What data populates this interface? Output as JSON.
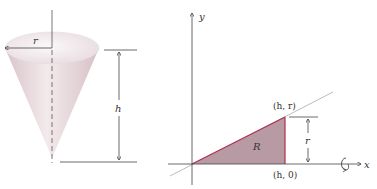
{
  "figure": {
    "left": {
      "title": "cone",
      "labels": {
        "radius": "r",
        "height": "h"
      }
    },
    "right": {
      "title": "region-diagram",
      "labels": {
        "y_axis": "y",
        "x_axis": "x",
        "region": "R",
        "point_top": "(h, r)",
        "point_bottom": "(h, 0)",
        "side": "r"
      }
    },
    "colors": {
      "cone_fill": "#e8d8dc",
      "cone_top": "#f2ecee",
      "region_fill": "#b89aa4",
      "region_edge": "#b0304e",
      "axis": "#444444",
      "line": "#aaaaaa"
    }
  }
}
